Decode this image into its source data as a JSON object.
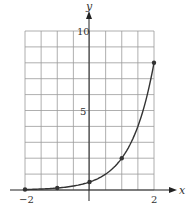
{
  "chart_data": {
    "type": "line",
    "title": "",
    "xlabel": "x",
    "ylabel": "y",
    "xlim": [
      -2,
      2
    ],
    "ylim": [
      0,
      10
    ],
    "grid": true,
    "x_ticks": [
      -2,
      2
    ],
    "x_tick_labels": [
      "−2",
      "2"
    ],
    "y_ticks": [
      5,
      10
    ],
    "y_tick_labels": [
      "5",
      "10"
    ],
    "grid_x_step": 0.5,
    "grid_y_step": 1,
    "series": [
      {
        "name": "curve",
        "function": "y = 0.5 * 4^x",
        "points": [
          {
            "x": -2,
            "y": 0.03
          },
          {
            "x": -1,
            "y": 0.125
          },
          {
            "x": 0,
            "y": 0.5
          },
          {
            "x": 1,
            "y": 2
          },
          {
            "x": 2,
            "y": 8
          }
        ]
      }
    ],
    "legend": null
  },
  "colors": {
    "grid": "#9a9a9a",
    "axis": "#222222",
    "curve": "#333333",
    "points": "#333333"
  }
}
